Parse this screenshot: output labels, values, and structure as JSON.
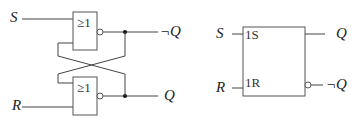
{
  "left_diagram": {
    "title": "",
    "inputs": {
      "s_label": "S",
      "r_label": "R"
    },
    "gates": [
      {
        "symbol": "≥1",
        "type": "NOR"
      },
      {
        "symbol": "≥1",
        "type": "NOR"
      }
    ],
    "outputs": {
      "top_label": "¬Q",
      "bottom_label": "Q"
    }
  },
  "right_diagram": {
    "inputs": {
      "s_label": "S",
      "r_label": "R"
    },
    "pins": {
      "s_pin": "1S",
      "r_pin": "1R"
    },
    "outputs": {
      "top_label": "Q",
      "bottom_label": "¬Q"
    }
  },
  "colors": {
    "line": "#444444",
    "background": "#ffffff"
  }
}
